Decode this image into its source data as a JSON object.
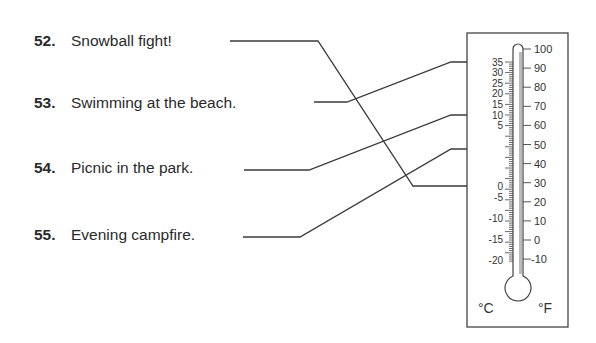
{
  "items": [
    {
      "number": "52.",
      "label": "Snowball fight!",
      "answer_celsius": 0
    },
    {
      "number": "53.",
      "label": "Swimming at the beach.",
      "answer_celsius": 35
    },
    {
      "number": "54.",
      "label": "Picnic in the park.",
      "answer_celsius": 20
    },
    {
      "number": "55.",
      "label": "Evening campfire.",
      "answer_celsius": 10
    }
  ],
  "thermometer": {
    "celsius_unit": "°C",
    "fahrenheit_unit": "°F",
    "celsius_labels": [
      "35",
      "30",
      "25",
      "20",
      "15",
      "10",
      "5",
      "0",
      "-5",
      "-10",
      "-15",
      "-20"
    ],
    "fahrenheit_labels": [
      "100",
      "90",
      "80",
      "70",
      "60",
      "50",
      "40",
      "30",
      "20",
      "10",
      "0",
      "-10"
    ],
    "arrow_marks_celsius": [
      "35",
      "20",
      "10",
      "0"
    ]
  },
  "colors": {
    "line": "#3a3a3a",
    "text": "#2a2a2a",
    "box_border": "#444444"
  }
}
